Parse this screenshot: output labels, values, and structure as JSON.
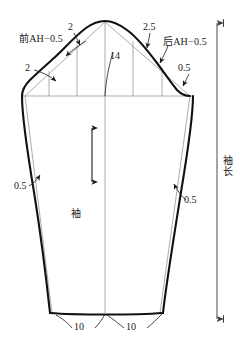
{
  "diagram": {
    "type": "sleeve-pattern-draft",
    "line_color": "#1a1a1a",
    "construction_line_color": "#7a7a7a",
    "background": "#ffffff"
  },
  "labels": {
    "front_armhole": "前AH−0.5",
    "back_armhole": "后AH−0.5",
    "cap_front_ease": "2",
    "cap_front_low_ease": "2",
    "cap_back_ease": "2.5",
    "cap_back_low_ease": "0.5",
    "cap_height": "14",
    "left_seam_offset": "0.5",
    "right_seam_offset": "0.5",
    "hem_left": "10",
    "hem_right": "10",
    "grain_label": "袖",
    "sleeve_length": "袖长"
  },
  "measurements": [
    {
      "name": "cap-height",
      "value": "14",
      "unit": "cm"
    },
    {
      "name": "front-cap-ease-upper",
      "value": "2",
      "unit": "cm"
    },
    {
      "name": "front-cap-ease-lower",
      "value": "2",
      "unit": "cm"
    },
    {
      "name": "back-cap-ease-upper",
      "value": "2.5",
      "unit": "cm"
    },
    {
      "name": "back-cap-ease-lower",
      "value": "0.5",
      "unit": "cm"
    },
    {
      "name": "front-underarm-seam-offset",
      "value": "0.5",
      "unit": "cm"
    },
    {
      "name": "back-underarm-seam-offset",
      "value": "0.5",
      "unit": "cm"
    },
    {
      "name": "hem-half-width-left",
      "value": "10",
      "unit": "cm"
    },
    {
      "name": "hem-half-width-right",
      "value": "10",
      "unit": "cm"
    },
    {
      "name": "front-armhole-guide",
      "value": "前AH−0.5",
      "unit": ""
    },
    {
      "name": "back-armhole-guide",
      "value": "后AH−0.5",
      "unit": ""
    },
    {
      "name": "sleeve-length-dimension",
      "value": "袖长",
      "unit": ""
    }
  ]
}
